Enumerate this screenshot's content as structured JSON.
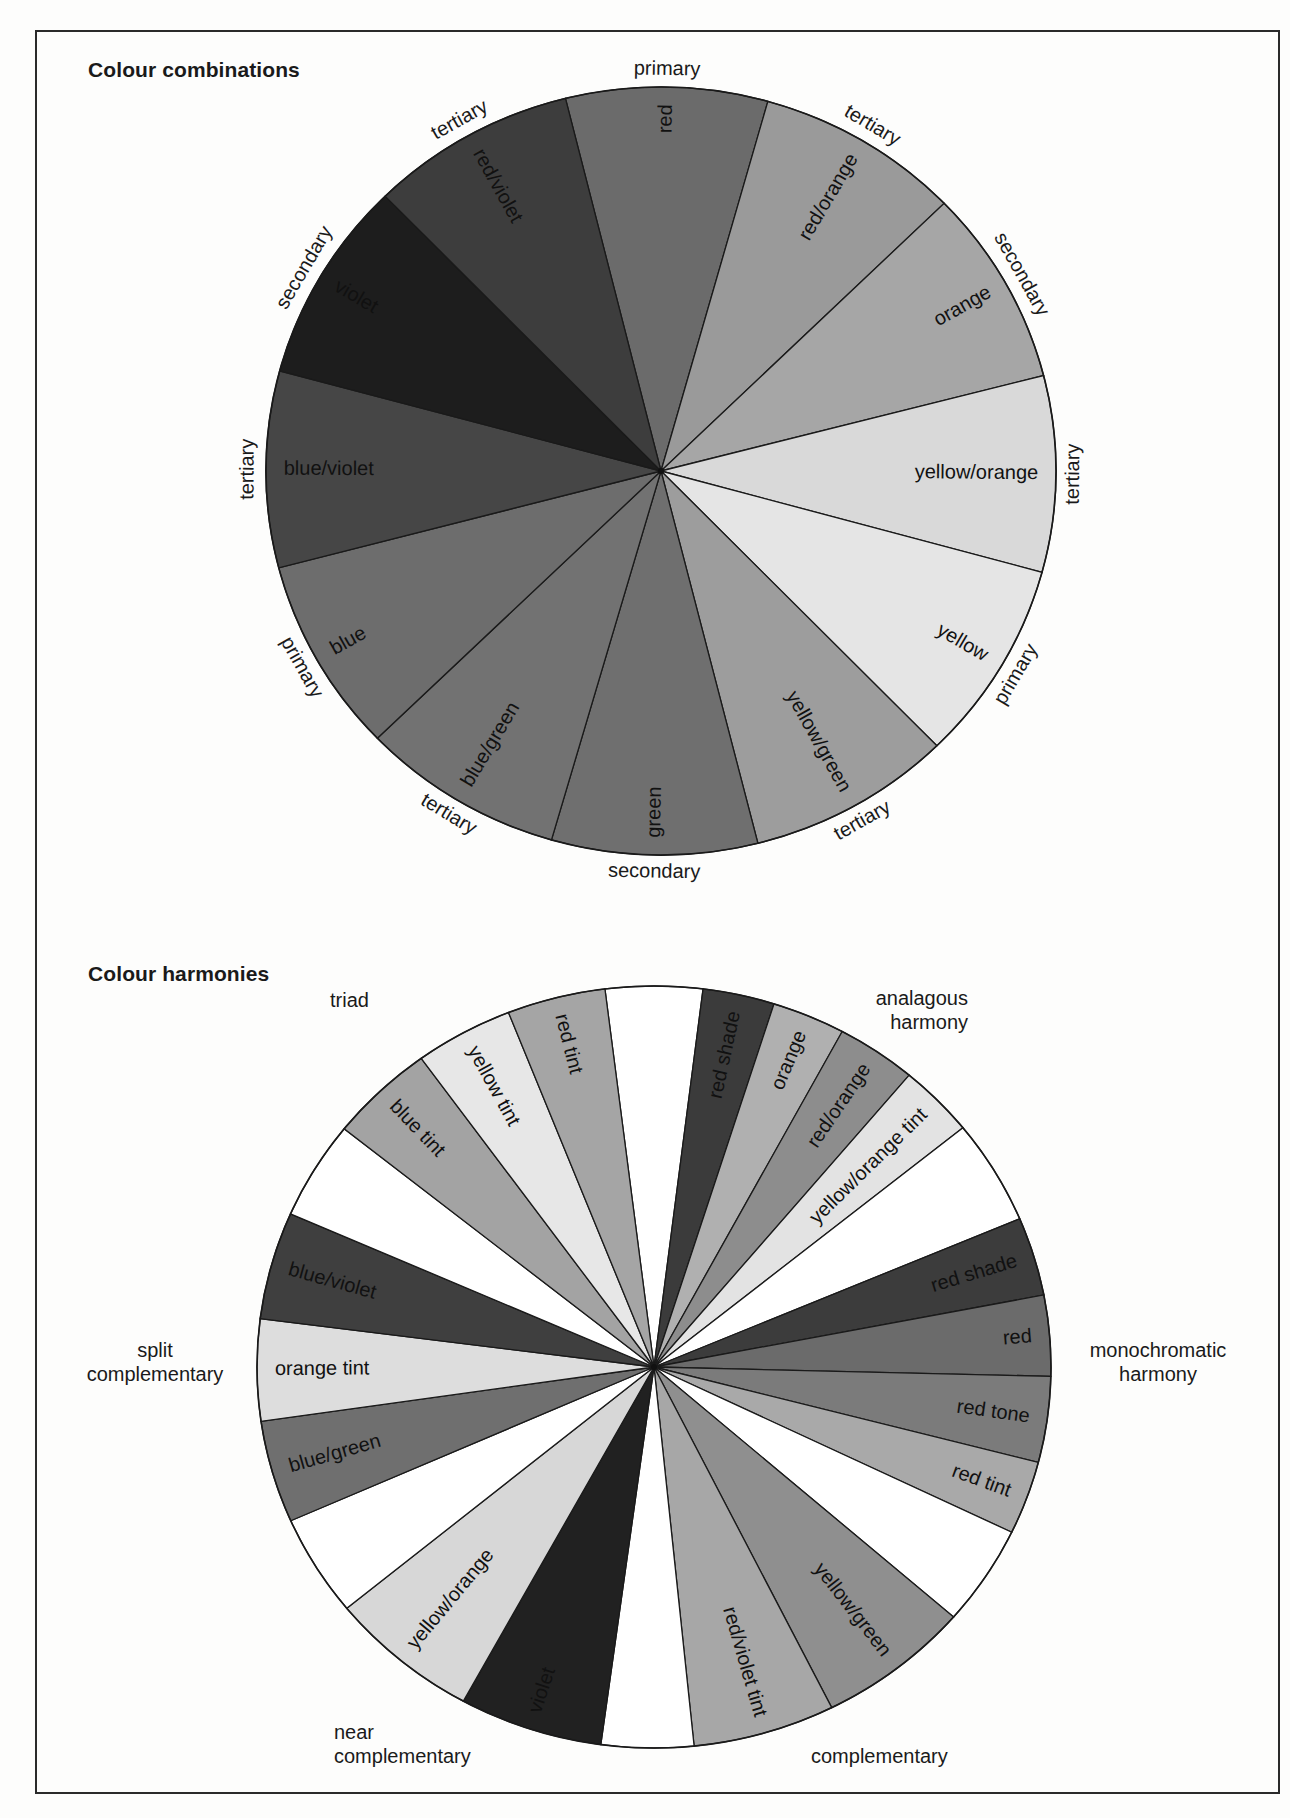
{
  "page": {
    "section1_title": "Colour combinations",
    "section2_title": "Colour harmonies",
    "harmony_labels": {
      "triad": "triad",
      "analagous_1": "analagous",
      "analagous_2": "harmony",
      "split_1": "split",
      "split_2": "complementary",
      "mono_1": "monochromatic",
      "mono_2": "harmony",
      "near_1": "near",
      "near_2": "complementary",
      "complementary": "complementary"
    }
  },
  "chart_data": [
    {
      "type": "pie",
      "title": "Colour combinations",
      "geometry": {
        "cx": 661,
        "cy": 471,
        "rx": 395,
        "ry": 384
      },
      "wedges": [
        {
          "label": "red",
          "category": "primary",
          "start": -104.0,
          "end": -74.3,
          "fill": "#6b6b6b"
        },
        {
          "label": "red/orange",
          "category": "tertiary",
          "start": -74.3,
          "end": -44.2,
          "fill": "#9a9a9a"
        },
        {
          "label": "orange",
          "category": "secondary",
          "start": -44.2,
          "end": -14.4,
          "fill": "#a6a6a6"
        },
        {
          "label": "yellow/orange",
          "category": "tertiary",
          "start": -14.4,
          "end": 15.3,
          "fill": "#d9d9d9"
        },
        {
          "label": "yellow",
          "category": "primary",
          "start": 15.3,
          "end": 45.7,
          "fill": "#e5e5e5"
        },
        {
          "label": "yellow/green",
          "category": "tertiary",
          "start": 45.7,
          "end": 75.8,
          "fill": "#9d9d9d"
        },
        {
          "label": "green",
          "category": "secondary",
          "start": 75.8,
          "end": 106.1,
          "fill": "#6f6f6f"
        },
        {
          "label": "blue/green",
          "category": "tertiary",
          "start": 106.1,
          "end": 135.9,
          "fill": "#727272"
        },
        {
          "label": "blue",
          "category": "primary",
          "start": 135.9,
          "end": 165.4,
          "fill": "#6d6d6d"
        },
        {
          "label": "blue/violet",
          "category": "tertiary",
          "start": 165.4,
          "end": 195.1,
          "fill": "#464646"
        },
        {
          "label": "violet",
          "category": "secondary",
          "start": 195.1,
          "end": 225.7,
          "fill": "#1d1d1d"
        },
        {
          "label": "red/violet",
          "category": "tertiary",
          "start": 225.7,
          "end": 256.0,
          "fill": "#3d3d3d"
        }
      ]
    },
    {
      "type": "pie",
      "title": "Colour harmonies",
      "geometry": {
        "cx": 654,
        "cy": 1367,
        "rx": 397,
        "ry": 381
      },
      "wedges": [
        {
          "label": "",
          "start": -97.1,
          "end": -82.9,
          "fill": "#ffffff"
        },
        {
          "label": "red shade",
          "start": -82.9,
          "end": -72.4,
          "fill": "#3b3b3b"
        },
        {
          "label": "orange",
          "start": -72.4,
          "end": -61.7,
          "fill": "#b0b0b0"
        },
        {
          "label": "red/orange",
          "start": -61.7,
          "end": -50.0,
          "fill": "#8d8d8d"
        },
        {
          "label": "yellow/orange tint",
          "start": -50.0,
          "end": -38.9,
          "fill": "#e3e3e3"
        },
        {
          "label": "",
          "start": -38.9,
          "end": -22.9,
          "fill": "#ffffff"
        },
        {
          "label": "red shade",
          "start": -22.9,
          "end": -10.9,
          "fill": "#3c3c3c"
        },
        {
          "label": "red",
          "start": -10.9,
          "end": 1.4,
          "fill": "#6b6b6b"
        },
        {
          "label": "red tone",
          "start": 1.4,
          "end": 14.5,
          "fill": "#7b7b7b"
        },
        {
          "label": "red tint",
          "start": 14.5,
          "end": 25.7,
          "fill": "#a9a9a9"
        },
        {
          "label": "",
          "start": 25.7,
          "end": 41.0,
          "fill": "#ffffff"
        },
        {
          "label": "yellow/green",
          "start": 41.0,
          "end": 63.4,
          "fill": "#8f8f8f"
        },
        {
          "label": "red/violet tint",
          "start": 63.4,
          "end": 84.2,
          "fill": "#a7a7a7"
        },
        {
          "label": "",
          "start": 84.2,
          "end": 97.7,
          "fill": "#ffffff"
        },
        {
          "label": "violet",
          "start": 97.7,
          "end": 118.7,
          "fill": "#212121"
        },
        {
          "label": "yellow/orange",
          "start": 118.7,
          "end": 140.7,
          "fill": "#d7d7d7"
        },
        {
          "label": "",
          "start": 140.7,
          "end": 156.2,
          "fill": "#ffffff"
        },
        {
          "label": "blue/green",
          "start": 156.2,
          "end": 171.8,
          "fill": "#6f6f6f"
        },
        {
          "label": "orange tint",
          "start": 171.8,
          "end": 187.3,
          "fill": "#dddddd"
        },
        {
          "label": "blue/violet",
          "start": 187.3,
          "end": 203.7,
          "fill": "#3f3f3f"
        },
        {
          "label": "",
          "start": 203.7,
          "end": 218.7,
          "fill": "#ffffff"
        },
        {
          "label": "blue tint",
          "start": 218.7,
          "end": 234.1,
          "fill": "#a3a3a3"
        },
        {
          "label": "yellow tint",
          "start": 234.1,
          "end": 248.5,
          "fill": "#e7e7e7"
        },
        {
          "label": "red tint",
          "start": 248.5,
          "end": 262.9,
          "fill": "#a5a5a5"
        }
      ]
    }
  ]
}
